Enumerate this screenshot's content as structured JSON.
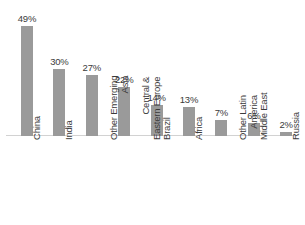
{
  "chart_data": {
    "type": "bar",
    "title": "",
    "subtitle": "",
    "xlabel": "",
    "ylabel": "",
    "ylim": [
      0,
      49
    ],
    "grid": false,
    "legend": false,
    "orientation": "vertical",
    "value_suffix": "%",
    "bar_color": "#9a9a9a",
    "axis_color": "#d2d2d2",
    "text_color": "#3b3b3b",
    "background": "#ffffff",
    "categories": [
      "China",
      "India",
      "Other Emerging Asia",
      "Central & Eastern Europe",
      "Brazil",
      "Africa",
      "Other Latin America",
      "Middle East",
      "Russia"
    ],
    "category_lines": [
      [
        "China"
      ],
      [
        "India"
      ],
      [
        "Other Emerging",
        "Asia"
      ],
      [
        "Central &",
        "Eastern Europe"
      ],
      [
        "Brazil"
      ],
      [
        "Africa"
      ],
      [
        "Other Latin",
        "America"
      ],
      [
        "Middle East"
      ],
      [
        "Russia"
      ]
    ],
    "values": [
      49,
      30,
      27,
      22,
      14,
      13,
      7,
      6,
      2
    ],
    "value_labels": [
      "49%",
      "30%",
      "27%",
      "22%",
      "14%",
      "13%",
      "7%",
      "6%",
      "2%"
    ]
  }
}
